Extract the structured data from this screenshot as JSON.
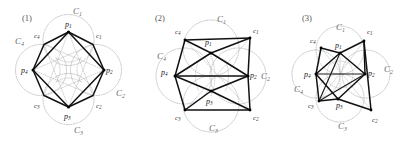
{
  "figure": {
    "type": "geometric-diagram",
    "background_color": "#ffffff",
    "panel_count": 3
  },
  "colors": {
    "ink": "#111111",
    "circle_stroke": "#9a9a9a",
    "caption": "#555555",
    "label_big": "#6a6a6a",
    "label_point": "#1a1a1a",
    "label_center": "#3a3a3a"
  },
  "panels": [
    {
      "id": "panel-1",
      "caption": "(1)",
      "caption_x": 22,
      "caption_y": 21,
      "shape": "octagon",
      "circles": [
        {
          "name": "C1",
          "letter": "C",
          "sub": "1",
          "cx": 68.5,
          "cy": 40.0,
          "r": 25.5,
          "label_x": 73,
          "label_y": 14
        },
        {
          "name": "C2",
          "letter": "C",
          "sub": "2",
          "cx": 96.0,
          "cy": 70.0,
          "r": 25.5,
          "label_x": 116,
          "label_y": 96
        },
        {
          "name": "C3",
          "letter": "C",
          "sub": "3",
          "cx": 68.5,
          "cy": 99.0,
          "r": 25.5,
          "label_x": 74,
          "label_y": 133
        },
        {
          "name": "C4",
          "letter": "C",
          "sub": "4",
          "cx": 41.0,
          "cy": 70.0,
          "r": 25.5,
          "label_x": 15,
          "label_y": 44
        }
      ],
      "points": [
        {
          "name": "p1",
          "letter": "p",
          "sub": "1",
          "x": 68.5,
          "y": 32.0,
          "label_x": 65,
          "label_y": 27
        },
        {
          "name": "p2",
          "letter": "p",
          "sub": "2",
          "x": 104.0,
          "y": 70.0,
          "label_x": 106,
          "label_y": 73
        },
        {
          "name": "p3",
          "letter": "p",
          "sub": "3",
          "x": 68.5,
          "y": 107.0,
          "label_x": 64,
          "label_y": 119
        },
        {
          "name": "p4",
          "letter": "p",
          "sub": "4",
          "x": 33.0,
          "y": 70.0,
          "label_x": 21,
          "label_y": 73
        }
      ],
      "centers": [
        {
          "name": "c1",
          "letter": "c",
          "sub": "1",
          "x": 93.0,
          "y": 44.5,
          "label_x": 96,
          "label_y": 38
        },
        {
          "name": "c2",
          "letter": "c",
          "sub": "2",
          "x": 93.0,
          "y": 95.5,
          "label_x": 96,
          "label_y": 108
        },
        {
          "name": "c3",
          "letter": "c",
          "sub": "3",
          "x": 44.0,
          "y": 95.5,
          "label_x": 34,
          "label_y": 108
        },
        {
          "name": "c4",
          "letter": "c",
          "sub": "4",
          "x": 44.0,
          "y": 44.5,
          "label_x": 34,
          "label_y": 38
        }
      ]
    },
    {
      "id": "panel-2",
      "caption": "(2)",
      "caption_x": 18,
      "caption_y": 21,
      "shape": "bowtie",
      "circles": [
        {
          "name": "C1",
          "letter": "C",
          "sub": "1",
          "cx": 74.0,
          "cy": 48.0,
          "r": 28.0,
          "label_x": 80,
          "label_y": 22
        },
        {
          "name": "C2",
          "letter": "C",
          "sub": "2",
          "cx": 101.0,
          "cy": 76.0,
          "r": 28.0,
          "label_x": 124,
          "label_y": 79
        },
        {
          "name": "C3",
          "letter": "C",
          "sub": "3",
          "cx": 74.0,
          "cy": 104.0,
          "r": 28.0,
          "label_x": 72,
          "label_y": 131
        },
        {
          "name": "C4",
          "letter": "C",
          "sub": "4",
          "cx": 47.0,
          "cy": 76.0,
          "r": 28.0,
          "label_x": 20,
          "label_y": 59
        }
      ],
      "points": [
        {
          "name": "p1",
          "letter": "p",
          "sub": "1",
          "x": 74.0,
          "y": 53.0,
          "label_x": 68,
          "label_y": 45
        },
        {
          "name": "p2",
          "letter": "p",
          "sub": "2",
          "x": 111.0,
          "y": 76.0,
          "label_x": 113,
          "label_y": 78
        },
        {
          "name": "p3",
          "letter": "p",
          "sub": "3",
          "x": 74.0,
          "y": 91.0,
          "label_x": 69,
          "label_y": 104
        },
        {
          "name": "p4",
          "letter": "p",
          "sub": "4",
          "x": 38.0,
          "y": 76.0,
          "label_x": 24,
          "label_y": 75
        }
      ],
      "centers": [
        {
          "name": "c1",
          "letter": "c",
          "sub": "1",
          "x": 113.0,
          "y": 38.0,
          "label_x": 116,
          "label_y": 33
        },
        {
          "name": "c2",
          "letter": "c",
          "sub": "2",
          "x": 113.0,
          "y": 110.0,
          "label_x": 116,
          "label_y": 120
        },
        {
          "name": "c3",
          "letter": "c",
          "sub": "3",
          "x": 48.0,
          "y": 110.0,
          "label_x": 38,
          "label_y": 120
        },
        {
          "name": "c4",
          "letter": "c",
          "sub": "4",
          "x": 48.0,
          "y": 40.0,
          "label_x": 38,
          "label_y": 34
        }
      ]
    },
    {
      "id": "panel-3",
      "caption": "(3)",
      "caption_x": 28,
      "caption_y": 21,
      "shape": "star-crossed",
      "circles": [
        {
          "name": "C1",
          "letter": "C",
          "sub": "1",
          "cx": 66.0,
          "cy": 50.0,
          "r": 24.0,
          "label_x": 62,
          "label_y": 30
        },
        {
          "name": "C2",
          "letter": "C",
          "sub": "2",
          "cx": 92.0,
          "cy": 74.0,
          "r": 24.0,
          "label_x": 110,
          "label_y": 72
        },
        {
          "name": "C3",
          "letter": "C",
          "sub": "3",
          "cx": 66.0,
          "cy": 98.0,
          "r": 24.0,
          "label_x": 64,
          "label_y": 129
        },
        {
          "name": "C4",
          "letter": "C",
          "sub": "4",
          "cx": 42.0,
          "cy": 74.0,
          "r": 24.0,
          "label_x": 20,
          "label_y": 92
        }
      ],
      "points": [
        {
          "name": "p1",
          "letter": "p",
          "sub": "1",
          "x": 66.0,
          "y": 53.0,
          "label_x": 61,
          "label_y": 48
        },
        {
          "name": "p2",
          "letter": "p",
          "sub": "2",
          "x": 91.0,
          "y": 74.0,
          "label_x": 94,
          "label_y": 76
        },
        {
          "name": "p3",
          "letter": "p",
          "sub": "3",
          "x": 64.0,
          "y": 99.0,
          "label_x": 62,
          "label_y": 108
        },
        {
          "name": "p4",
          "letter": "p",
          "sub": "4",
          "x": 42.0,
          "y": 74.0,
          "label_x": 30,
          "label_y": 77
        }
      ],
      "centers": [
        {
          "name": "c1",
          "letter": "c",
          "sub": "1",
          "x": 90.0,
          "y": 41.0,
          "label_x": 93,
          "label_y": 34
        },
        {
          "name": "c2",
          "letter": "c",
          "sub": "2",
          "x": 97.0,
          "cy": 0,
          "y": 110.0,
          "label_x": 98,
          "label_y": 122
        },
        {
          "name": "c3",
          "letter": "c",
          "sub": "3",
          "x": 45.0,
          "y": 101.0,
          "label_x": 34,
          "label_y": 108
        },
        {
          "name": "c4",
          "letter": "c",
          "sub": "4",
          "x": 47.0,
          "y": 48.0,
          "label_x": 36,
          "label_y": 43
        }
      ]
    }
  ]
}
